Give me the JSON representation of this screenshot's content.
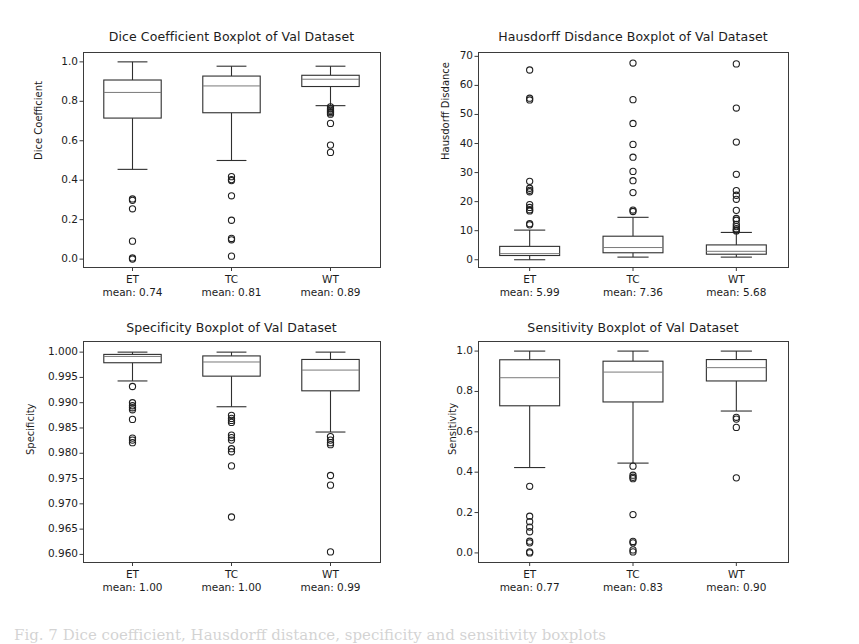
{
  "figure": {
    "width": 859,
    "height": 640,
    "background": "#ffffff",
    "caption": "Fig. 7 Dice coefficient, Hausdorff distance, specificity and sensitivity boxplots"
  },
  "chart_data": [
    {
      "id": "dice",
      "type": "box",
      "title": "Dice Coefficient Boxplot of Val Dataset",
      "xlabel": "",
      "ylabel": "Dice Coefficient",
      "ylim": [
        -0.04,
        1.05
      ],
      "yticks": [
        0.0,
        0.2,
        0.4,
        0.6,
        0.8,
        1.0
      ],
      "ytick_labels": [
        "0.0",
        "0.2",
        "0.4",
        "0.6",
        "0.8",
        "1.0"
      ],
      "grid": false,
      "legend": "none",
      "categories": [
        "ET",
        "TC",
        "WT"
      ],
      "means": [
        0.74,
        0.81,
        0.89
      ],
      "mean_labels": [
        "mean: 0.74",
        "mean: 0.81",
        "mean: 0.89"
      ],
      "boxes": [
        {
          "category": "ET",
          "whisker_low": 0.455,
          "q1": 0.715,
          "median": 0.845,
          "q3": 0.908,
          "whisker_high": 1.0,
          "outliers": [
            0.305,
            0.298,
            0.255,
            0.091,
            0.006,
            0.0
          ]
        },
        {
          "category": "TC",
          "whisker_low": 0.5,
          "q1": 0.742,
          "median": 0.878,
          "q3": 0.928,
          "whisker_high": 0.978,
          "outliers": [
            0.418,
            0.403,
            0.398,
            0.321,
            0.197,
            0.105,
            0.098,
            0.015
          ]
        },
        {
          "category": "WT",
          "whisker_low": 0.778,
          "q1": 0.875,
          "median": 0.912,
          "q3": 0.932,
          "whisker_high": 0.978,
          "outliers": [
            0.772,
            0.762,
            0.755,
            0.748,
            0.742,
            0.735,
            0.688,
            0.578,
            0.541
          ]
        }
      ]
    },
    {
      "id": "hausdorff",
      "type": "box",
      "title": "Hausdorff Disdance Boxplot of Val Dataset",
      "xlabel": "",
      "ylabel": "Hausdorff Disdance",
      "ylim": [
        -2.5,
        71.5
      ],
      "yticks": [
        0,
        10,
        20,
        30,
        40,
        50,
        60,
        70
      ],
      "ytick_labels": [
        "0",
        "10",
        "20",
        "30",
        "40",
        "50",
        "60",
        "70"
      ],
      "grid": false,
      "legend": "none",
      "categories": [
        "ET",
        "TC",
        "WT"
      ],
      "means": [
        5.99,
        7.36,
        5.68
      ],
      "mean_labels": [
        "mean: 5.99",
        "mean: 7.36",
        "mean: 5.68"
      ],
      "boxes": [
        {
          "category": "ET",
          "whisker_low": 0.0,
          "q1": 1.45,
          "median": 2.1,
          "q3": 4.6,
          "whisker_high": 10.2,
          "outliers": [
            65.3,
            55.6,
            55.0,
            27.0,
            24.6,
            23.9,
            23.4,
            19.0,
            18.0,
            17.2,
            16.8,
            12.4,
            12.0
          ]
        },
        {
          "category": "TC",
          "whisker_low": 0.9,
          "q1": 2.4,
          "median": 4.2,
          "q3": 8.1,
          "whisker_high": 14.6,
          "outliers": [
            67.7,
            55.1,
            46.9,
            39.7,
            35.3,
            30.4,
            27.2,
            23.1,
            17.1,
            16.6
          ]
        },
        {
          "category": "WT",
          "whisker_low": 0.9,
          "q1": 1.9,
          "median": 2.9,
          "q3": 5.1,
          "whisker_high": 9.4,
          "outliers": [
            67.4,
            52.2,
            40.5,
            29.4,
            23.8,
            22.2,
            20.8,
            17.0,
            14.2,
            13.6,
            12.2,
            11.4,
            10.7,
            10.2,
            9.9
          ]
        }
      ]
    },
    {
      "id": "specificity",
      "type": "box",
      "title": "Specificity Boxplot of Val Dataset",
      "xlabel": "",
      "ylabel": "Specificity",
      "ylim": [
        0.9585,
        1.0022
      ],
      "yticks": [
        0.96,
        0.965,
        0.97,
        0.975,
        0.98,
        0.985,
        0.99,
        0.995,
        1.0
      ],
      "ytick_labels": [
        "0.960",
        "0.965",
        "0.970",
        "0.975",
        "0.980",
        "0.985",
        "0.990",
        "0.995",
        "1.000"
      ],
      "grid": false,
      "legend": "none",
      "categories": [
        "ET",
        "TC",
        "WT"
      ],
      "means": [
        1.0,
        1.0,
        0.99
      ],
      "mean_labels": [
        "mean: 1.00",
        "mean: 1.00",
        "mean: 0.99"
      ],
      "boxes": [
        {
          "category": "ET",
          "whisker_low": 0.9943,
          "q1": 0.9979,
          "median": 0.99915,
          "q3": 0.99955,
          "whisker_high": 1.0,
          "outliers": [
            0.9932,
            0.99,
            0.9894,
            0.989,
            0.9886,
            0.9867,
            0.983,
            0.9826,
            0.9821
          ]
        },
        {
          "category": "TC",
          "whisker_low": 0.9892,
          "q1": 0.99525,
          "median": 0.99805,
          "q3": 0.99925,
          "whisker_high": 1.0,
          "outliers": [
            0.9875,
            0.9869,
            0.9865,
            0.9861,
            0.9836,
            0.9831,
            0.9826,
            0.9809,
            0.9803,
            0.9775,
            0.9674
          ]
        },
        {
          "category": "WT",
          "whisker_low": 0.9842,
          "q1": 0.99235,
          "median": 0.99645,
          "q3": 0.99855,
          "whisker_high": 1.0,
          "outliers": [
            0.9833,
            0.9826,
            0.9821,
            0.9817,
            0.9756,
            0.9737,
            0.9605
          ]
        }
      ]
    },
    {
      "id": "sensitivity",
      "type": "box",
      "title": "Sensitivity Boxplot of Val Dataset",
      "xlabel": "",
      "ylabel": "Sensitivity",
      "ylim": [
        -0.045,
        1.05
      ],
      "yticks": [
        0.0,
        0.2,
        0.4,
        0.6,
        0.8,
        1.0
      ],
      "ytick_labels": [
        "0.0",
        "0.2",
        "0.4",
        "0.6",
        "0.8",
        "1.0"
      ],
      "grid": false,
      "legend": "none",
      "categories": [
        "ET",
        "TC",
        "WT"
      ],
      "means": [
        0.77,
        0.83,
        0.9
      ],
      "mean_labels": [
        "mean: 0.77",
        "mean: 0.83",
        "mean: 0.90"
      ],
      "boxes": [
        {
          "category": "ET",
          "whisker_low": 0.423,
          "q1": 0.729,
          "median": 0.868,
          "q3": 0.957,
          "whisker_high": 1.0,
          "outliers": [
            0.33,
            0.182,
            0.155,
            0.128,
            0.105,
            0.058,
            0.05,
            0.005,
            0.0
          ]
        },
        {
          "category": "TC",
          "whisker_low": 0.445,
          "q1": 0.748,
          "median": 0.896,
          "q3": 0.95,
          "whisker_high": 1.0,
          "outliers": [
            0.43,
            0.385,
            0.375,
            0.368,
            0.19,
            0.057,
            0.05,
            0.015,
            0.005
          ]
        },
        {
          "category": "WT",
          "whisker_low": 0.703,
          "q1": 0.852,
          "median": 0.918,
          "q3": 0.958,
          "whisker_high": 1.0,
          "outliers": [
            0.672,
            0.663,
            0.622,
            0.372
          ]
        }
      ]
    }
  ]
}
